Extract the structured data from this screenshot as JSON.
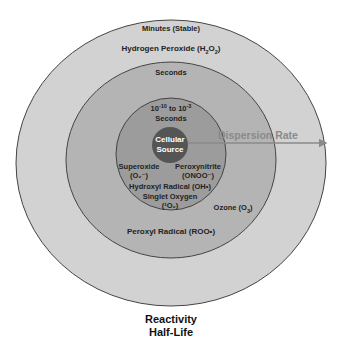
{
  "colors": {
    "outer_ring": "#d2d2d2",
    "middle_ring": "#b4b4b4",
    "inner_ring": "#9c9c9c",
    "core": "#555555",
    "stroke": "#444444",
    "arrow": "#8a8a8a"
  },
  "rings": {
    "outer": {
      "timescale": "Minutes (Stable)",
      "species": [
        {
          "name": "Hydrogen Peroxide",
          "formula": "H2O2",
          "label": "Hydrogen Peroxide (H₂O₂)"
        }
      ]
    },
    "middle": {
      "timescale": "Seconds",
      "species": [
        {
          "name": "Ozone",
          "formula": "O3",
          "label": "Ozone (O₃)"
        },
        {
          "name": "Peroxyl Radical",
          "formula": "ROO•",
          "label": "Peroxyl Radical (ROO•)"
        }
      ]
    },
    "inner": {
      "timescale_line1": "10⁻¹⁰ to 10⁻³",
      "timescale_line2": "Seconds",
      "species": [
        {
          "name": "Superoxide",
          "formula": "(O₂⁻)"
        },
        {
          "name": "Peroxynitrite",
          "formula": "(ONOO⁻)"
        },
        {
          "name": "Hydroxyl Radical",
          "formula": "OH•",
          "label": "Hydroxyl Radical (OH•)"
        },
        {
          "name": "Singlet Oxygen",
          "formula": "(¹O₂)"
        }
      ]
    },
    "core": {
      "line1": "Cellular",
      "line2": "Source"
    }
  },
  "arrow": {
    "label": "Dispersion Rate"
  },
  "axis_caption": {
    "line1": "Reactivity",
    "line2": "Half-Life"
  }
}
